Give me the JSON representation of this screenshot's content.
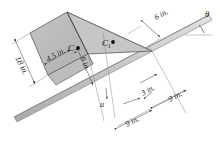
{
  "figure": {
    "angle_label": "θ",
    "axis_label": "u",
    "centroids": [
      {
        "name": "C1",
        "label": "C",
        "subscript": "1"
      },
      {
        "name": "C2",
        "label": "C",
        "subscript": "2"
      }
    ],
    "dimensions": [
      {
        "name": "left-height",
        "value": "18 in."
      },
      {
        "name": "top-offset",
        "value": "4.5 in."
      },
      {
        "name": "centroid2-depth",
        "value": "9 in."
      },
      {
        "name": "right-top",
        "value": "6 in."
      },
      {
        "name": "centroid1-offset",
        "value": "3 in."
      },
      {
        "name": "lower-span",
        "value": "9 in."
      },
      {
        "name": "right-span",
        "value": "9 in."
      }
    ],
    "colors": {
      "shade_fill": "#b8b8b8",
      "shade_fill_light": "#c9c9c9",
      "bar_fill": "#d0d0d0",
      "line": "#4a4a4a",
      "dim_line": "#555555",
      "background": "#ffffff"
    }
  }
}
